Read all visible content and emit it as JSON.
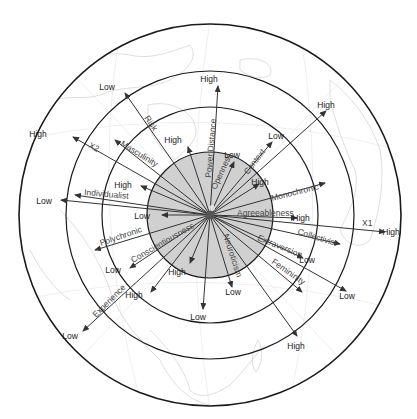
{
  "diagram": {
    "center": {
      "x": 210,
      "y": 215
    },
    "colors": {
      "ring_stroke": "#1a1a1a",
      "inner_fill": "#c8c8c8",
      "arrow": "#333333",
      "label": "#444444",
      "end_label": "#222222",
      "map": "#d0d0d0"
    },
    "rings": [
      {
        "name": "outer-ring",
        "radius": 191
      },
      {
        "name": "ring-3",
        "radius": 144
      },
      {
        "name": "ring-2",
        "radius": 108
      },
      {
        "name": "inner-core",
        "radius": 63,
        "filled": true
      }
    ],
    "axes": [
      {
        "id": "x1",
        "label": "X1",
        "end": "High",
        "tip": [
          385,
          232
        ],
        "label_pos": [
          362,
          226
        ],
        "end_pos": [
          391,
          235
        ],
        "label_rot": 0
      },
      {
        "id": "x2",
        "label": "X2",
        "end": "High",
        "tip": [
          73,
          137
        ],
        "label_pos": [
          88,
          147
        ],
        "end_pos": [
          38,
          137
        ],
        "label_rot": 30
      },
      {
        "id": "risk",
        "label": "Risk",
        "end": "Low",
        "tip": [
          125,
          93
        ],
        "label_pos": [
          144,
          118
        ],
        "end_pos": [
          107,
          90
        ],
        "label_rot": 55
      },
      {
        "id": "masculinity",
        "label": "Masculinity",
        "end": "",
        "tip": [
          115,
          140
        ],
        "label_pos": [
          120,
          145
        ],
        "end_pos": [
          0,
          0
        ],
        "label_rot": 32
      },
      {
        "id": "power-distance",
        "label": "Power Distance",
        "end": "High",
        "tip": [
          218,
          86
        ],
        "label_pos": [
          211,
          178
        ],
        "end_pos": [
          209,
          82
        ],
        "label_rot": -85
      },
      {
        "id": "openness",
        "label": "Openness",
        "end": "Low",
        "tip": [
          234,
          162
        ],
        "label_pos": [
          216,
          190
        ],
        "end_pos": [
          232,
          158
        ],
        "label_rot": -65
      },
      {
        "id": "context",
        "label": "Context",
        "end": "Low",
        "tip": [
          272,
          142
        ],
        "label_pos": [
          248,
          175
        ],
        "end_pos": [
          276,
          139
        ],
        "label_rot": -53
      },
      {
        "id": "x-upper-right",
        "label": "",
        "end": "High",
        "tip": [
          326,
          111
        ],
        "label_pos": [
          0,
          0
        ],
        "end_pos": [
          326,
          108
        ],
        "label_rot": 0
      },
      {
        "id": "upper-high",
        "label": "",
        "end": "High",
        "tip": [
          188,
          147
        ],
        "label_pos": [
          0,
          0
        ],
        "end_pos": [
          173,
          143
        ],
        "label_rot": 0
      },
      {
        "id": "neuroticism-high",
        "label": "",
        "end": "High",
        "tip": [
          259,
          184
        ],
        "label_pos": [
          0,
          0
        ],
        "end_pos": [
          260,
          185
        ],
        "label_rot": 0
      },
      {
        "id": "monochronic",
        "label": "Monochronic",
        "end": "",
        "tip": [
          325,
          183
        ],
        "label_pos": [
          272,
          201
        ],
        "end_pos": [
          0,
          0
        ],
        "label_rot": -14
      },
      {
        "id": "agreeableness",
        "label": "Agreeableness",
        "end": "High",
        "tip": [
          297,
          218
        ],
        "label_pos": [
          237,
          216
        ],
        "end_pos": [
          301,
          221
        ],
        "label_rot": 0
      },
      {
        "id": "collectivist",
        "label": "Collectivist",
        "end": "",
        "tip": [
          340,
          244
        ],
        "label_pos": [
          297,
          234
        ],
        "end_pos": [
          0,
          0
        ],
        "label_rot": 17
      },
      {
        "id": "extraversion",
        "label": "Extraversion",
        "end": "Low",
        "tip": [
          303,
          258
        ],
        "label_pos": [
          257,
          240
        ],
        "end_pos": [
          307,
          263
        ],
        "label_rot": 22
      },
      {
        "id": "femininity",
        "label": "Femininity",
        "end": "",
        "tip": [
          302,
          292
        ],
        "label_pos": [
          271,
          263
        ],
        "end_pos": [
          0,
          0
        ],
        "label_rot": 35
      },
      {
        "id": "lower-right-low",
        "label": "",
        "end": "Low",
        "tip": [
          346,
          291
        ],
        "label_pos": [
          0,
          0
        ],
        "end_pos": [
          347,
          299
        ],
        "label_rot": 0
      },
      {
        "id": "lower-right-high",
        "label": "",
        "end": "High",
        "tip": [
          297,
          336
        ],
        "label_pos": [
          0,
          0
        ],
        "end_pos": [
          296,
          349
        ],
        "label_rot": 0
      },
      {
        "id": "neuroticism",
        "label": "Neuroticism",
        "end": "Low",
        "tip": [
          232,
          287
        ],
        "label_pos": [
          223,
          235
        ],
        "end_pos": [
          233,
          295
        ],
        "label_rot": 72
      },
      {
        "id": "bottom-low",
        "label": "",
        "end": "Low",
        "tip": [
          203,
          309
        ],
        "label_pos": [
          0,
          0
        ],
        "end_pos": [
          198,
          320
        ],
        "label_rot": 0
      },
      {
        "id": "lower-high",
        "label": "",
        "end": "High",
        "tip": [
          190,
          263
        ],
        "label_pos": [
          0,
          0
        ],
        "end_pos": [
          177,
          275
        ],
        "label_rot": 0
      },
      {
        "id": "conscientiousness",
        "label": "Conscientiousness",
        "end": "Low",
        "tip": [
          130,
          268
        ],
        "label_pos": [
          133,
          263
        ],
        "end_pos": [
          113,
          273
        ],
        "label_rot": -30
      },
      {
        "id": "lower-left-high",
        "label": "",
        "end": "High",
        "tip": [
          151,
          292
        ],
        "label_pos": [
          0,
          0
        ],
        "end_pos": [
          134,
          298
        ],
        "label_rot": 0
      },
      {
        "id": "polychronic",
        "label": "Polychronic",
        "end": "",
        "tip": [
          95,
          250
        ],
        "label_pos": [
          101,
          246
        ],
        "end_pos": [
          0,
          0
        ],
        "label_rot": -19
      },
      {
        "id": "experience",
        "label": "Experience",
        "end": "Low",
        "tip": [
          83,
          331
        ],
        "label_pos": [
          96,
          318
        ],
        "end_pos": [
          70,
          339
        ],
        "label_rot": -45
      },
      {
        "id": "individualist",
        "label": "Individualist",
        "end": "",
        "tip": [
          75,
          195
        ],
        "label_pos": [
          84,
          195
        ],
        "end_pos": [
          0,
          0
        ],
        "label_rot": 5
      },
      {
        "id": "left-low",
        "label": "",
        "end": "Low",
        "tip": [
          61,
          200
        ],
        "label_pos": [
          0,
          0
        ],
        "end_pos": [
          44,
          204
        ],
        "label_rot": 0
      },
      {
        "id": "inner-left-low",
        "label": "",
        "end": "Low",
        "tip": [
          162,
          215
        ],
        "label_pos": [
          0,
          0
        ],
        "end_pos": [
          142,
          219
        ],
        "label_rot": 0
      },
      {
        "id": "inner-left-high",
        "label": "",
        "end": "High",
        "tip": [
          141,
          186
        ],
        "label_pos": [
          0,
          0
        ],
        "end_pos": [
          123,
          188
        ],
        "label_rot": 0
      }
    ]
  }
}
